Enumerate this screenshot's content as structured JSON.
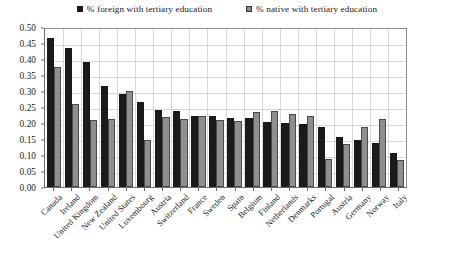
{
  "chart_data": {
    "type": "bar",
    "title": "",
    "subtitle": "",
    "xlabel": "",
    "ylabel": "",
    "ylim": [
      0.0,
      0.5
    ],
    "ytick_labels": [
      "0.00",
      "0.05",
      "0.10",
      "0.15",
      "0.20",
      "0.25",
      "0.30",
      "0.35",
      "0.40",
      "0.45",
      "0.50"
    ],
    "ytick_values": [
      0.0,
      0.05,
      0.1,
      0.15,
      0.2,
      0.25,
      0.3,
      0.35,
      0.4,
      0.45,
      0.5
    ],
    "grid": true,
    "legend_position": "top-center",
    "categories": [
      "Canada",
      "Ireland",
      "United Kingdom",
      "New Zealand",
      "United States",
      "Luxembourg",
      "Austria",
      "Switzerland",
      "France",
      "Sweden",
      "Spain",
      "Belgium",
      "Finland",
      "Netherlands",
      "Denmarks",
      "Portugal",
      "Austria",
      "Germany",
      "Norway",
      "Italy"
    ],
    "series": [
      {
        "name": "% foreign with tertiary education",
        "color": "#1a1a1a",
        "values": [
          0.465,
          0.435,
          0.39,
          0.315,
          0.29,
          0.265,
          0.24,
          0.237,
          0.222,
          0.222,
          0.217,
          0.215,
          0.202,
          0.2,
          0.196,
          0.186,
          0.155,
          0.148,
          0.137,
          0.105
        ]
      },
      {
        "name": "% native with tertiary education",
        "color": "#8f8f8f",
        "values": [
          0.375,
          0.26,
          0.21,
          0.211,
          0.3,
          0.146,
          0.218,
          0.214,
          0.222,
          0.208,
          0.206,
          0.235,
          0.238,
          0.227,
          0.222,
          0.089,
          0.133,
          0.189,
          0.212,
          0.083
        ]
      }
    ]
  }
}
